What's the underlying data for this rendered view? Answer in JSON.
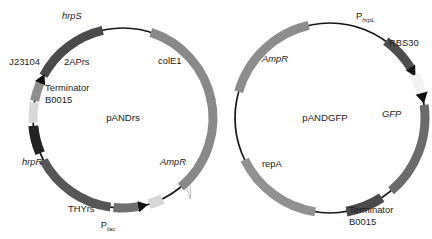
{
  "figure": {
    "type": "diagram",
    "subtype": "plasmid-map",
    "background": "#ffffff",
    "width": 432,
    "height": 239
  },
  "plasmids": [
    {
      "id": "pANDrs",
      "name": "pANDrs",
      "name_x": 123,
      "name_y": 118,
      "cx": 123,
      "cy": 118,
      "r": 90,
      "backbone_color": "#161616",
      "features": [
        {
          "key": "hrpS",
          "label": "hrpS",
          "italic": true,
          "color": "#4a4a4a",
          "start": -62,
          "end": -13,
          "thickness": 9,
          "arrow": "none",
          "label_x": 62,
          "label_y": 17,
          "anchor": "start"
        },
        {
          "key": "2APrs",
          "label": "2APrs",
          "italic": false,
          "color": "#8e8e8e",
          "start": -79,
          "end": -63,
          "thickness": 9,
          "arrow": "cw",
          "label_x": 64,
          "label_y": 63,
          "anchor": "start"
        },
        {
          "key": "J23104",
          "label": "J23104",
          "italic": false,
          "color": "#d9d9d9",
          "start": -93,
          "end": -80,
          "thickness": 9,
          "arrow": "none",
          "label_x": 40,
          "label_y": 63,
          "anchor": "end"
        },
        {
          "key": "TerminatorB0015_left",
          "label": "Terminator",
          "label2": "B0015",
          "italic": false,
          "color": "#232323",
          "start": -113,
          "end": -95,
          "thickness": 10,
          "arrow": "none",
          "label_x": 45,
          "label_y": 89,
          "anchor": "start"
        },
        {
          "key": "hrpR",
          "label": "hrpR",
          "italic": true,
          "color": "#565656",
          "start": -172,
          "end": -118,
          "thickness": 9,
          "arrow": "none",
          "label_x": 22,
          "label_y": 163,
          "anchor": "start"
        },
        {
          "key": "THYrs",
          "label": "THYrs",
          "italic": false,
          "color": "#6f6f6f",
          "start": -194,
          "end": -174,
          "thickness": 9,
          "arrow": "ccw",
          "label_x": 68,
          "label_y": 210,
          "anchor": "start"
        },
        {
          "key": "Ptac",
          "label": "P",
          "sublabel": "tac",
          "sub_italic": true,
          "italic": false,
          "color": "#d6d6d6",
          "start": -206,
          "end": -197,
          "thickness": 10,
          "arrow": "none",
          "label_x": 108,
          "label_y": 226,
          "anchor": "middle"
        },
        {
          "key": "AmpR_left",
          "label": "AmpR",
          "italic": true,
          "color": "#898989",
          "start": -284,
          "end": -220,
          "thickness": 9,
          "arrow": "none",
          "label_x": 160,
          "label_y": 163,
          "anchor": "start"
        },
        {
          "key": "colE1",
          "label": "colE1",
          "italic": false,
          "color": "#898989",
          "start": 18,
          "end": 79,
          "thickness": 9,
          "arrow": "none",
          "label_x": 158,
          "label_y": 62,
          "anchor": "start"
        }
      ]
    },
    {
      "id": "pANDGFP",
      "name": "pANDGFP",
      "name_x": 325,
      "name_y": 118,
      "cx": 330,
      "cy": 118,
      "r": 95,
      "backbone_color": "#161616",
      "features": [
        {
          "key": "PhrpL",
          "label": "P",
          "sublabel": "hrpL",
          "sub_italic": true,
          "italic": false,
          "color": "#4d4d4d",
          "start": 36,
          "end": 62,
          "thickness": 9,
          "arrow": "cw",
          "label_x": 356,
          "label_y": 17,
          "anchor": "start"
        },
        {
          "key": "RBS30",
          "label": "RBS30",
          "italic": false,
          "color": "#f2f2f2",
          "start": 63,
          "end": 79,
          "thickness": 10,
          "arrow": "cw",
          "label_x": 389,
          "label_y": 44,
          "anchor": "start"
        },
        {
          "key": "GFP",
          "label": "GFP",
          "italic": true,
          "color": "#6b6b6b",
          "start": 82,
          "end": 140,
          "thickness": 9,
          "arrow": "none",
          "label_x": 382,
          "label_y": 115,
          "anchor": "start"
        },
        {
          "key": "TerminatorB0015_right",
          "label": "Terminator",
          "label2": "B0015",
          "italic": false,
          "color": "#4a4a4a",
          "start": 147,
          "end": 170,
          "thickness": 10,
          "arrow": "none",
          "label_x": 349,
          "label_y": 211,
          "anchor": "start"
        },
        {
          "key": "repA",
          "label": "repA",
          "italic": false,
          "color": "#919191",
          "start": 189,
          "end": 244,
          "thickness": 9,
          "arrow": "none",
          "label_x": 262,
          "label_y": 165,
          "anchor": "start"
        },
        {
          "key": "AmpR_right",
          "label": "AmpR",
          "italic": true,
          "color": "#8d8d8d",
          "start": 286,
          "end": 347,
          "thickness": 9,
          "arrow": "none",
          "label_x": 262,
          "label_y": 60,
          "anchor": "start"
        }
      ]
    }
  ]
}
